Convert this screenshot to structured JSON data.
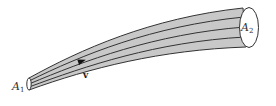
{
  "figure": {
    "type": "flow-tube-diagram",
    "labels": {
      "inlet_area": "A",
      "inlet_sub": "1",
      "outlet_area": "A",
      "outlet_sub": "2",
      "velocity": "v"
    },
    "colors": {
      "tube_fill": "#c8c8c8",
      "stroke": "#333333",
      "cap_fill": "#ffffff"
    },
    "streamline_count": 3
  }
}
